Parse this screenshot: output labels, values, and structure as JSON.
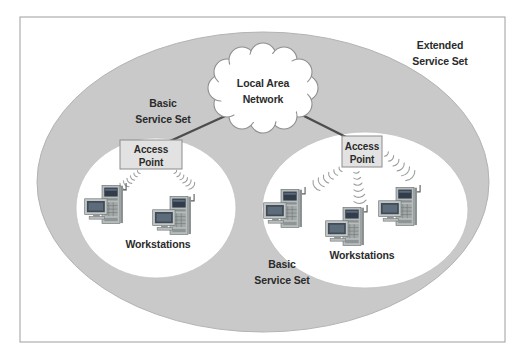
{
  "diagram": {
    "ess": {
      "label_line1": "Extended",
      "label_line2": "Service Set"
    },
    "lan": {
      "label_line1": "Local Area",
      "label_line2": "Network"
    },
    "bss_left": {
      "label_line1": "Basic",
      "label_line2": "Service Set",
      "ap_line1": "Access",
      "ap_line2": "Point",
      "workstations_label": "Workstations",
      "workstation_count": 2
    },
    "bss_right": {
      "label_line1": "Basic",
      "label_line2": "Service Set",
      "ap_line1": "Access",
      "ap_line2": "Point",
      "workstations_label": "Workstations",
      "workstation_count": 3
    },
    "icons": {
      "cloud": "lan-cloud-icon",
      "workstation": "workstation-icon",
      "radio_waves": "radio-waves-icon"
    },
    "colors": {
      "ess_fill": "#c9c9c9",
      "ess_stroke": "#b3b3b3",
      "bss_fill": "#ffffff",
      "bss_stroke": "#c2c2c2",
      "cloud_fill": "#ffffff",
      "cloud_stroke": "#8f8f8f",
      "ap_fill": "#e2e2e2",
      "ap_stroke": "#8c8c8c",
      "link_line": "#4d4d4d",
      "wave": "#9aa0a0",
      "text": "#2b2b2b",
      "frame": "#9e9e9e"
    }
  }
}
